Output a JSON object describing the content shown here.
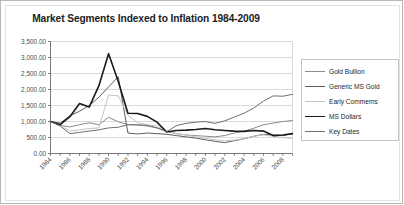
{
  "chart_data": {
    "type": "line",
    "title": "Market Segments Indexed to Inflation 1984-2009",
    "xlabel": "",
    "ylabel": "",
    "xlim": [
      1984,
      2009
    ],
    "ylim": [
      0,
      3500
    ],
    "grid": true,
    "legend_position": "right",
    "ytick_labels": [
      "3,500.00",
      "3,000.00",
      "2,500.00",
      "2,000.00",
      "1,500.00",
      "1,000.00",
      "500.00",
      "0.00"
    ],
    "ytick_values": [
      3500,
      3000,
      2500,
      2000,
      1500,
      1000,
      500,
      0
    ],
    "xtick_labels": [
      "1984",
      "1986",
      "1988",
      "1990",
      "1992",
      "1994",
      "1996",
      "1998",
      "2000",
      "2002",
      "2004",
      "2006",
      "2008"
    ],
    "xtick_values": [
      1984,
      1986,
      1988,
      1990,
      1992,
      1994,
      1996,
      1998,
      2000,
      2002,
      2004,
      2006,
      2008
    ],
    "x": [
      1984,
      1985,
      1986,
      1987,
      1988,
      1989,
      1990,
      1991,
      1992,
      1993,
      1994,
      1995,
      1996,
      1997,
      1998,
      1999,
      2000,
      2001,
      2002,
      2003,
      2004,
      2005,
      2006,
      2007,
      2008,
      2009
    ],
    "series": [
      {
        "name": "Gold Bullion",
        "color": "#8c8c8c",
        "width": 1,
        "values": [
          1000,
          880,
          830,
          900,
          960,
          900,
          1130,
          990,
          900,
          900,
          860,
          800,
          700,
          620,
          580,
          560,
          540,
          520,
          560,
          640,
          700,
          790,
          900,
          950,
          1000,
          1030
        ]
      },
      {
        "name": "Generic MS Gold",
        "color": "#5e5e5e",
        "width": 1,
        "values": [
          1000,
          950,
          1180,
          1320,
          1500,
          1760,
          2080,
          2400,
          640,
          610,
          640,
          620,
          600,
          560,
          520,
          480,
          430,
          380,
          340,
          400,
          460,
          540,
          600,
          580,
          560,
          620
        ]
      },
      {
        "name": "Early Commems",
        "color": "#c4c4c4",
        "width": 1,
        "values": [
          1000,
          880,
          700,
          740,
          780,
          800,
          1830,
          1800,
          1200,
          960,
          900,
          860,
          700,
          620,
          580,
          520,
          470,
          430,
          400,
          420,
          460,
          540,
          580,
          540,
          500,
          470
        ]
      },
      {
        "name": "MS Dollars",
        "color": "#1a1a1a",
        "width": 1.6,
        "values": [
          1000,
          900,
          1150,
          1560,
          1450,
          2120,
          3120,
          2250,
          1260,
          1250,
          1160,
          980,
          670,
          720,
          730,
          750,
          780,
          740,
          720,
          700,
          690,
          720,
          700,
          560,
          580,
          620
        ]
      },
      {
        "name": "Key Dates",
        "color": "#6f6f6f",
        "width": 1,
        "values": [
          1000,
          860,
          620,
          660,
          700,
          740,
          800,
          820,
          900,
          890,
          880,
          800,
          680,
          870,
          940,
          980,
          1000,
          940,
          1020,
          1140,
          1260,
          1420,
          1640,
          1800,
          1790,
          1850
        ]
      }
    ]
  }
}
